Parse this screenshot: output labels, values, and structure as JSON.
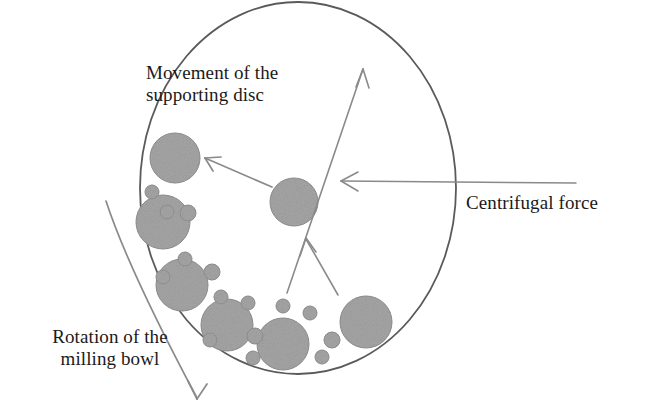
{
  "figure": {
    "background_color": "#ffffff",
    "outline_color": "#5a5a5a",
    "ball_fill_color": "#a3a3a3",
    "ball_stroke_color": "#8a8a8a",
    "arrow_color": "#7a7a7a",
    "text_color": "#1a1a1a"
  },
  "labels": {
    "movement": "Movement of the\nsupporting disc",
    "centrifugal": "Centrifugal force",
    "rotation": "Rotation of the\nmilling bowl"
  },
  "bowl": {
    "name": "milling-bowl-outline",
    "center_x": 298,
    "center_y": 188,
    "radius_x": 158,
    "radius_y": 186
  },
  "balls": {
    "large": [
      {
        "cx": 175,
        "cy": 158,
        "r": 25
      },
      {
        "cx": 163,
        "cy": 222,
        "r": 27
      },
      {
        "cx": 182,
        "cy": 285,
        "r": 26
      },
      {
        "cx": 227,
        "cy": 325,
        "r": 26
      },
      {
        "cx": 283,
        "cy": 344,
        "r": 26
      },
      {
        "cx": 366,
        "cy": 322,
        "r": 26
      },
      {
        "cx": 294,
        "cy": 202,
        "r": 24
      }
    ],
    "small": [
      {
        "cx": 152,
        "cy": 192,
        "r": 7
      },
      {
        "cx": 167,
        "cy": 212,
        "r": 7
      },
      {
        "cx": 188,
        "cy": 213,
        "r": 8
      },
      {
        "cx": 185,
        "cy": 259,
        "r": 7
      },
      {
        "cx": 163,
        "cy": 277,
        "r": 7
      },
      {
        "cx": 212,
        "cy": 272,
        "r": 8
      },
      {
        "cx": 221,
        "cy": 297,
        "r": 7
      },
      {
        "cx": 248,
        "cy": 303,
        "r": 7
      },
      {
        "cx": 210,
        "cy": 340,
        "r": 7
      },
      {
        "cx": 255,
        "cy": 336,
        "r": 8
      },
      {
        "cx": 253,
        "cy": 358,
        "r": 7
      },
      {
        "cx": 283,
        "cy": 306,
        "r": 7
      },
      {
        "cx": 310,
        "cy": 313,
        "r": 7
      },
      {
        "cx": 332,
        "cy": 340,
        "r": 8
      },
      {
        "cx": 322,
        "cy": 357,
        "r": 7
      },
      {
        "cx": 234,
        "cy": 200,
        "r": 0
      }
    ]
  },
  "arrows": [
    {
      "name": "supporting-disc-arrow",
      "description": "short diagonal arrow pointing up-left toward large upper ball",
      "from_x": 272,
      "from_y": 187,
      "to_x": 203,
      "to_y": 157
    },
    {
      "name": "centrifugal-force-arrow",
      "description": "long horizontal arrow pointing left into the bowl",
      "from_x": 576,
      "from_y": 183,
      "to_x": 340,
      "to_y": 181
    },
    {
      "name": "disc-rotation-arrow",
      "description": "long diagonal arrow pointing up-right across the bowl",
      "from_x": 287,
      "from_y": 292,
      "to_x": 363,
      "to_y": 68
    },
    {
      "name": "disc-rotation-arrow-second-leg",
      "description": "second leg of the V meeting the diagonal arrow head",
      "from_x": 337,
      "from_y": 294,
      "to_x": 306,
      "to_y": 239
    },
    {
      "name": "milling-bowl-rotation-arrow",
      "description": "long curved arrow outside bowl pointing down-right",
      "from_x": 106,
      "from_y": 201,
      "to_x": 199,
      "to_y": 403
    }
  ]
}
